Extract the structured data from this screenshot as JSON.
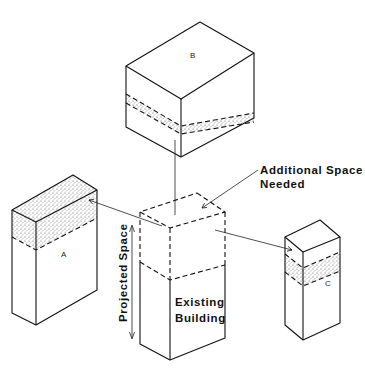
{
  "diagram": {
    "type": "isometric-building-expansion",
    "colors": {
      "line": "#111111",
      "stipple": "#b5b5b5",
      "background": "#ffffff"
    },
    "boxes": {
      "b": {
        "label": "B"
      },
      "a": {
        "label": "A"
      },
      "c": {
        "label": "C"
      },
      "existing": {
        "label_line1": "Existing",
        "label_line2": "Building"
      }
    },
    "annotations": {
      "additional_space_line1": "Additional Space",
      "additional_space_line2": "Needed",
      "projected_space": "Projected Space"
    }
  }
}
